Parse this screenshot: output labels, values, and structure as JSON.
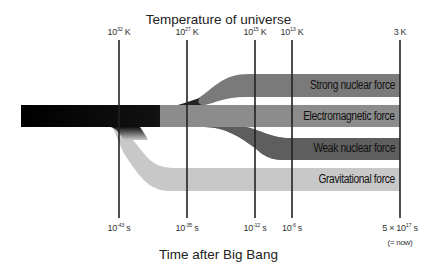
{
  "top_title": "Temperature of universe",
  "bottom_title": "Time after Big Bang",
  "temperature_ticks": [
    {
      "base": "10",
      "exp": "32",
      "unit": " K",
      "x": 119
    },
    {
      "base": "10",
      "exp": "27",
      "unit": " K",
      "x": 187
    },
    {
      "base": "10",
      "exp": "15",
      "unit": " K",
      "x": 255
    },
    {
      "base": "10",
      "exp": "13",
      "unit": " K",
      "x": 292
    },
    {
      "base": "",
      "exp": "",
      "unit": "3 K",
      "x": 400
    }
  ],
  "time_ticks": [
    {
      "base": "10",
      "exp": "-43",
      "unit": " s",
      "x": 119
    },
    {
      "base": "10",
      "exp": "-35",
      "unit": " s",
      "x": 187
    },
    {
      "base": "10",
      "exp": "-12",
      "unit": " s",
      "x": 255
    },
    {
      "base": "10",
      "exp": "-6",
      "unit": " s",
      "x": 292
    },
    {
      "base": "5 × 10",
      "exp": "17",
      "unit": " s",
      "x": 400
    }
  ],
  "now_note": "(= now)",
  "forces": [
    {
      "name": "Strong nuclear force",
      "color": "#7a7a7a"
    },
    {
      "name": "Electromagnetic force",
      "color": "#8c8c8c"
    },
    {
      "name": "Weak nuclear force",
      "color": "#5e5e5e"
    },
    {
      "name": "Gravitational force",
      "color": "#c8c8c8"
    }
  ]
}
